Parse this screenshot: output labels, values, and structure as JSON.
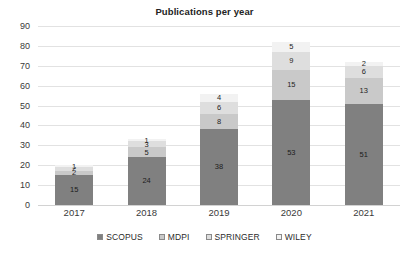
{
  "chart_data": {
    "type": "bar",
    "variant": "stacked",
    "title": "Publications per year",
    "xlabel": "",
    "ylabel": "",
    "categories": [
      "2017",
      "2018",
      "2019",
      "2020",
      "2021"
    ],
    "series": [
      {
        "name": "SCOPUS",
        "color": "#808080",
        "values": [
          15,
          24,
          38,
          53,
          51
        ]
      },
      {
        "name": "MDPI",
        "color": "#c9c9c9",
        "values": [
          2,
          5,
          8,
          15,
          13
        ]
      },
      {
        "name": "SPRINGER",
        "color": "#dedede",
        "values": [
          2,
          3,
          6,
          9,
          6
        ]
      },
      {
        "name": "WILEY",
        "color": "#f2f2f2",
        "values": [
          1,
          1,
          4,
          5,
          2
        ]
      }
    ],
    "totals": [
      20,
      33,
      56,
      82,
      72
    ],
    "ylim": [
      0,
      90
    ],
    "ytick_step": 10,
    "yticks": [
      "90",
      "80",
      "70",
      "60",
      "50",
      "40",
      "30",
      "20",
      "10",
      "0"
    ],
    "grid": true,
    "legend_position": "bottom"
  },
  "legend": {
    "items": [
      {
        "label": "SCOPUS"
      },
      {
        "label": "MDPI"
      },
      {
        "label": "SPRINGER"
      },
      {
        "label": "WILEY"
      }
    ]
  },
  "colors": {
    "scopus": "#808080",
    "mdpi": "#c9c9c9",
    "springer": "#dedede",
    "wiley": "#f2f2f2",
    "gridline": "#e2e2e2",
    "text": "#2b2b2b",
    "background": "#ffffff"
  }
}
